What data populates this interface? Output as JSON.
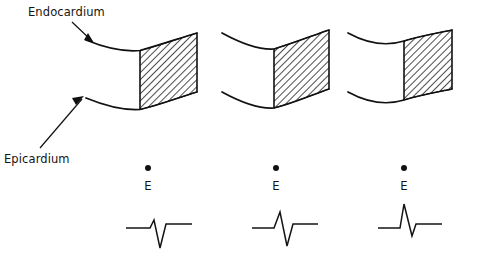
{
  "figure": {
    "type": "diagram",
    "background_color": "#ffffff",
    "ink_color": "#111111"
  },
  "annotations": [
    {
      "id": "endocardium",
      "label": "Endocardium",
      "label_x": 28,
      "label_y": 14,
      "points_to": "upper-wall-curve",
      "arrow_from_x": 70,
      "arrow_from_y": 22,
      "arrow_to_x": 92,
      "arrow_to_y": 40
    },
    {
      "id": "epicardium",
      "label": "Epicardium",
      "label_x": 6,
      "label_y": 160,
      "points_to": "lower-wall-curve",
      "arrow_from_x": 42,
      "arrow_from_y": 146,
      "arrow_to_x": 82,
      "arrow_to_y": 98
    }
  ],
  "panels": [
    {
      "id": "panel-1",
      "index": 1,
      "wall": {
        "left_x": 86,
        "right_x": 197,
        "top_left_y": 40,
        "top_mid_y": 52,
        "top_right_y": 33,
        "bottom_left_y": 98,
        "bottom_mid_y": 110,
        "bottom_right_y": 92
      },
      "infarct": {
        "start_x": 140,
        "end_x": 197,
        "hatch_angle_deg": 45,
        "description": "transmural hatched zone on right portion of wall"
      },
      "electrode": {
        "label": "E",
        "dot_x": 148,
        "dot_y": 168,
        "letter_x": 148,
        "letter_y": 190
      },
      "ecg": {
        "complex": "rS",
        "baseline_y": 228,
        "origin_x": 126,
        "width": 72,
        "r_amplitude": 8,
        "s_amplitude": 20,
        "description": "small r wave followed by deep S wave"
      }
    },
    {
      "id": "panel-2",
      "index": 2,
      "wall": {
        "left_x": 222,
        "right_x": 329,
        "top_left_y": 33,
        "top_mid_y": 50,
        "top_right_y": 30,
        "bottom_left_y": 92,
        "bottom_mid_y": 110,
        "bottom_right_y": 89
      },
      "infarct": {
        "start_x": 274,
        "end_x": 329,
        "hatch_angle_deg": 45,
        "description": "transmural hatched zone on right portion of wall"
      },
      "electrode": {
        "label": "E",
        "dot_x": 276,
        "dot_y": 168,
        "letter_x": 276,
        "letter_y": 190
      },
      "ecg": {
        "complex": "RS",
        "baseline_y": 228,
        "origin_x": 252,
        "width": 72,
        "r_amplitude": 16,
        "s_amplitude": 18,
        "description": "taller R wave followed by deep S wave"
      }
    },
    {
      "id": "panel-3",
      "index": 3,
      "wall": {
        "left_x": 348,
        "right_x": 452,
        "top_left_y": 33,
        "top_mid_y": 49,
        "top_right_y": 30,
        "bottom_left_y": 92,
        "bottom_mid_y": 110,
        "bottom_right_y": 89
      },
      "infarct": {
        "start_x": 404,
        "end_x": 452,
        "hatch_angle_deg": 45,
        "description": "narrow transmural hatched zone at right edge of wall"
      },
      "electrode": {
        "label": "E",
        "dot_x": 404,
        "dot_y": 168,
        "letter_x": 404,
        "letter_y": 190
      },
      "ecg": {
        "complex": "R",
        "baseline_y": 228,
        "origin_x": 378,
        "width": 72,
        "r_amplitude": 24,
        "s_amplitude": 5,
        "description": "tall R wave with minimal S wave"
      }
    }
  ]
}
